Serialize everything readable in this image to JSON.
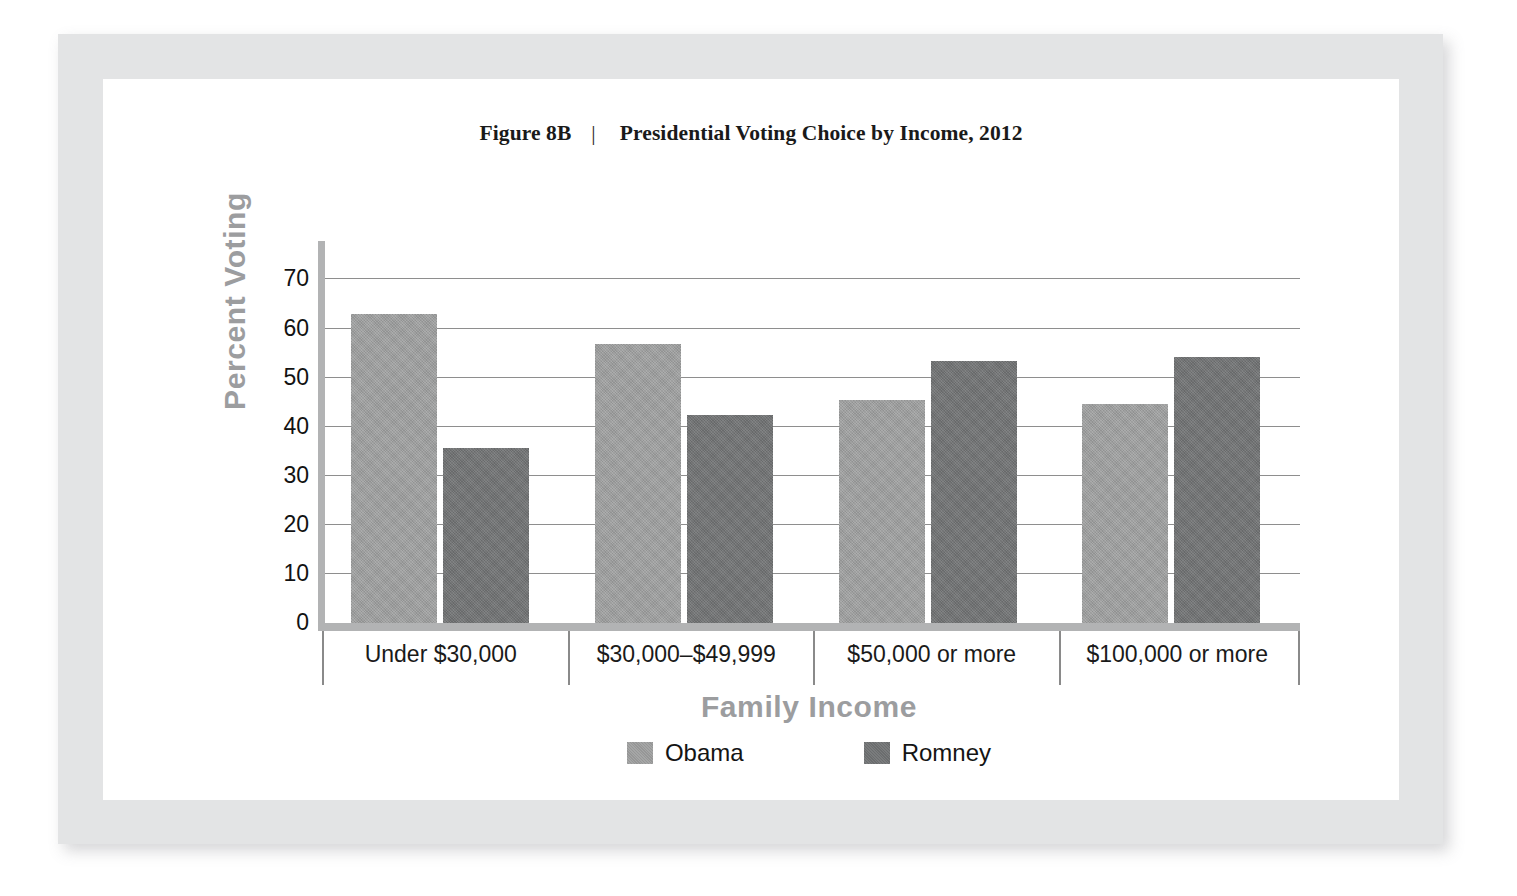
{
  "figure": {
    "number": "Figure 8B",
    "separator": "|",
    "caption": "Presidential Voting Choice by Income, 2012"
  },
  "chart_data": {
    "type": "bar",
    "title": "Presidential Voting Choice by Income, 2012",
    "xlabel": "Family Income",
    "ylabel": "Percent Voting",
    "ylim": [
      0,
      76
    ],
    "yticks": [
      0,
      10,
      20,
      30,
      40,
      50,
      60,
      70
    ],
    "ytick_labels": [
      "0",
      "10",
      "20",
      "30",
      "40",
      "50",
      "60",
      "70"
    ],
    "grid": true,
    "grid_axis": "y",
    "legend_position": "bottom",
    "categories": [
      "Under $30,000",
      "$30,000–$49,999",
      "$50,000 or more",
      "$100,000 or more"
    ],
    "series": [
      {
        "name": "Obama",
        "color": "#9b9c9c",
        "values": [
          63.0,
          56.8,
          45.4,
          44.7
        ]
      },
      {
        "name": "Romney",
        "color": "#6f7172",
        "values": [
          35.6,
          42.3,
          53.3,
          54.1
        ]
      }
    ]
  },
  "legend": {
    "entries": [
      {
        "label": "Obama",
        "color": "#9b9c9c"
      },
      {
        "label": "Romney",
        "color": "#6f7172"
      }
    ]
  },
  "style": {
    "frame_color": "#e3e4e5",
    "axis_color": "#b2b3b4",
    "gridline_color": "#8e8e8e",
    "axis_title_color": "#9c9d9f",
    "text_color": "#121212",
    "page_background": "#ffffff"
  }
}
